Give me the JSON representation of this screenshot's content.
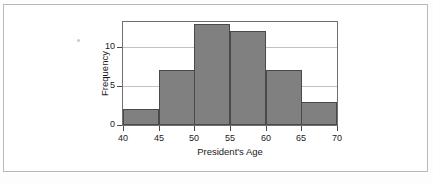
{
  "chart_data": {
    "type": "bar",
    "title": "",
    "xlabel": "President's Age",
    "ylabel": "Frequency",
    "categories": [
      "40-45",
      "45-50",
      "50-55",
      "55-60",
      "60-65",
      "65-70"
    ],
    "bin_edges": [
      40,
      45,
      50,
      55,
      60,
      65,
      70
    ],
    "values": [
      2,
      7,
      13,
      12,
      7,
      3
    ],
    "xtick_labels": [
      "40",
      "45",
      "50",
      "55",
      "60",
      "65",
      "70"
    ],
    "ytick_labels": [
      "0",
      "5",
      "10"
    ],
    "ytick_values": [
      0,
      5,
      10
    ],
    "xlim": [
      40,
      70
    ],
    "ylim": [
      0,
      13.2
    ],
    "grid": "horizontal",
    "legend": "none",
    "bar_color": "#808080",
    "bar_edge_color": "#4a4a4a",
    "grid_color": "#c2c2c2",
    "axis_color": "#6f6f6f",
    "plot_background": "#ffffff"
  },
  "page": {
    "background": "#fdfdfd",
    "frame_color": "#b9b9b9"
  }
}
